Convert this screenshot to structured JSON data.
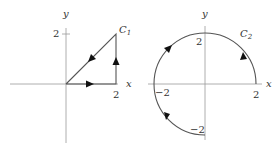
{
  "figure": {
    "left_panel": {
      "curve_label": "C",
      "curve_subscript": "1",
      "x_axis_label": "x",
      "y_axis_label": "y",
      "x_tick_label": "2",
      "y_tick_label": "2",
      "shape": "triangle",
      "vertices": [
        [
          0,
          0
        ],
        [
          2,
          0
        ],
        [
          2,
          2
        ]
      ],
      "orientation": "counterclockwise: (0,0) -> (2,0) -> (2,2) -> (0,0)"
    },
    "right_panel": {
      "curve_label": "C",
      "curve_subscript": "2",
      "x_axis_label": "x",
      "y_axis_label": "y",
      "tick_labels": {
        "x_pos": "2",
        "x_neg": "−2",
        "y_pos": "2",
        "y_neg": "−2"
      },
      "shape": "three-quarter circle arc",
      "radius": 2,
      "start_point": [
        2,
        0
      ],
      "end_point": [
        0,
        -2
      ],
      "orientation": "counterclockwise from angle 0 to 270 degrees"
    }
  }
}
